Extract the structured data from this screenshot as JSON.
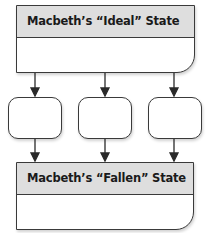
{
  "diagram": {
    "top_box": {
      "title": "Macbeth’s “Ideal” State",
      "body": ""
    },
    "middle_boxes": [
      {
        "label": ""
      },
      {
        "label": ""
      },
      {
        "label": ""
      }
    ],
    "bottom_box": {
      "title": "Macbeth’s “Fallen” State",
      "body": ""
    },
    "colors": {
      "header_fill": "#dedede",
      "stroke": "#3a3a3a",
      "background": "#ffffff"
    }
  }
}
